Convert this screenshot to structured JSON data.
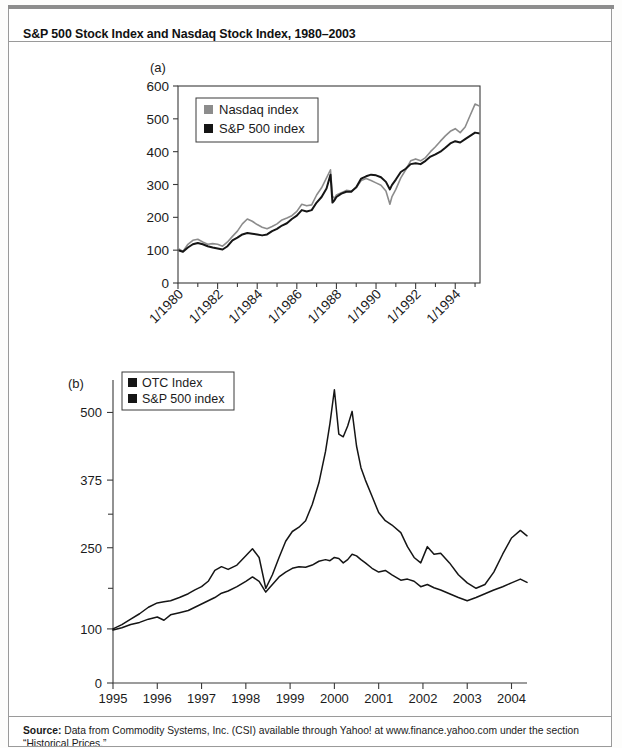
{
  "figure": {
    "title": "S&P 500 Stock Index and Nasdaq Stock Index, 1980–2003",
    "source_label": "Source:",
    "source_text": " Data from Commodity Systems, Inc. (CSI) available through Yahoo! at www.finance.yahoo.com under the section “Historical Prices.”"
  },
  "chart_data": [
    {
      "id": "panel-a",
      "type": "line",
      "panel_label": "(a)",
      "title": "",
      "xlabel": "",
      "ylabel": "",
      "grid": false,
      "legend_position": "top-left",
      "ylim": [
        0,
        600
      ],
      "yticks": [
        0,
        100,
        200,
        300,
        400,
        500,
        600
      ],
      "ytick_labels": [
        "0",
        "100",
        "200",
        "300",
        "400",
        "500",
        "600"
      ],
      "xlim": [
        1980,
        1995.25
      ],
      "xticks": [
        1980,
        1982,
        1984,
        1986,
        1988,
        1990,
        1992,
        1994
      ],
      "xtick_labels": [
        "1/1980",
        "1/1982",
        "1/1984",
        "1/1986",
        "1/1988",
        "1/1990",
        "1/1992",
        "1/1994"
      ],
      "xtick_minor": [
        1981,
        1983,
        1985,
        1987,
        1989,
        1991,
        1993,
        1995
      ],
      "series": [
        {
          "name": "Nasdaq index",
          "color": "#8c8c8c",
          "width": 1.6,
          "x": [
            1980.0,
            1980.25,
            1980.5,
            1980.75,
            1981.0,
            1981.25,
            1981.5,
            1981.75,
            1982.0,
            1982.25,
            1982.5,
            1982.75,
            1983.0,
            1983.25,
            1983.5,
            1983.75,
            1984.0,
            1984.25,
            1984.5,
            1984.75,
            1985.0,
            1985.25,
            1985.5,
            1985.75,
            1986.0,
            1986.25,
            1986.5,
            1986.75,
            1987.0,
            1987.25,
            1987.5,
            1987.7,
            1987.8,
            1987.9,
            1988.0,
            1988.25,
            1988.5,
            1988.75,
            1989.0,
            1989.25,
            1989.5,
            1989.75,
            1990.0,
            1990.25,
            1990.5,
            1990.7,
            1990.8,
            1991.0,
            1991.25,
            1991.5,
            1991.75,
            1992.0,
            1992.25,
            1992.5,
            1992.75,
            1993.0,
            1993.25,
            1993.5,
            1993.75,
            1994.0,
            1994.25,
            1994.5,
            1994.75,
            1995.0,
            1995.25
          ],
          "values": [
            105,
            96,
            118,
            130,
            133,
            125,
            118,
            120,
            118,
            112,
            125,
            142,
            158,
            180,
            195,
            188,
            178,
            170,
            165,
            172,
            180,
            192,
            198,
            205,
            218,
            240,
            235,
            238,
            268,
            290,
            320,
            345,
            265,
            258,
            268,
            275,
            282,
            280,
            290,
            312,
            318,
            312,
            305,
            298,
            280,
            240,
            262,
            285,
            320,
            345,
            372,
            378,
            372,
            382,
            400,
            415,
            432,
            448,
            462,
            470,
            458,
            475,
            510,
            545,
            538
          ]
        },
        {
          "name": "S&P 500 index",
          "color": "#151515",
          "width": 2.0,
          "x": [
            1980.0,
            1980.25,
            1980.5,
            1980.75,
            1981.0,
            1981.25,
            1981.5,
            1981.75,
            1982.0,
            1982.25,
            1982.5,
            1982.75,
            1983.0,
            1983.25,
            1983.5,
            1983.75,
            1984.0,
            1984.25,
            1984.5,
            1984.75,
            1985.0,
            1985.25,
            1985.5,
            1985.75,
            1986.0,
            1986.25,
            1986.5,
            1986.75,
            1987.0,
            1987.25,
            1987.5,
            1987.7,
            1987.8,
            1987.9,
            1988.0,
            1988.25,
            1988.5,
            1988.75,
            1989.0,
            1989.25,
            1989.5,
            1989.75,
            1990.0,
            1990.25,
            1990.5,
            1990.7,
            1990.8,
            1991.0,
            1991.25,
            1991.5,
            1991.75,
            1992.0,
            1992.25,
            1992.5,
            1992.75,
            1993.0,
            1993.25,
            1993.5,
            1993.75,
            1994.0,
            1994.25,
            1994.5,
            1994.75,
            1995.0,
            1995.25
          ],
          "values": [
            100,
            95,
            108,
            118,
            122,
            118,
            112,
            108,
            105,
            102,
            112,
            130,
            138,
            148,
            152,
            150,
            148,
            145,
            148,
            158,
            165,
            175,
            182,
            195,
            205,
            222,
            218,
            222,
            245,
            262,
            288,
            330,
            245,
            252,
            262,
            272,
            278,
            278,
            292,
            318,
            325,
            330,
            328,
            322,
            308,
            285,
            298,
            315,
            338,
            348,
            362,
            365,
            362,
            372,
            385,
            392,
            400,
            412,
            425,
            432,
            428,
            438,
            448,
            458,
            455
          ]
        }
      ]
    },
    {
      "id": "panel-b",
      "type": "line",
      "panel_label": "(b)",
      "title": "",
      "xlabel": "",
      "ylabel": "",
      "grid": false,
      "legend_position": "top-left",
      "ylim": [
        0,
        560
      ],
      "yticks": [
        0,
        100,
        250,
        375,
        500
      ],
      "ytick_labels": [
        "0",
        "100",
        "250",
        "375",
        "500"
      ],
      "ytick_minor": [
        175,
        312
      ],
      "xlim": [
        1995,
        2004.35
      ],
      "xticks": [
        1995,
        1996,
        1997,
        1998,
        1999,
        2000,
        2001,
        2002,
        2003,
        2004
      ],
      "xtick_labels": [
        "1995",
        "1996",
        "1997",
        "1998",
        "1999",
        "2000",
        "2001",
        "2002",
        "2003",
        "2004"
      ],
      "series": [
        {
          "name": "OTC Index",
          "color": "#151515",
          "width": 1.5,
          "x": [
            1995.0,
            1995.2,
            1995.4,
            1995.6,
            1995.8,
            1996.0,
            1996.15,
            1996.3,
            1996.5,
            1996.7,
            1996.85,
            1997.0,
            1997.15,
            1997.3,
            1997.45,
            1997.6,
            1997.8,
            1998.0,
            1998.15,
            1998.3,
            1998.45,
            1998.6,
            1998.75,
            1998.9,
            1999.05,
            1999.2,
            1999.35,
            1999.5,
            1999.65,
            1999.8,
            1999.9,
            2000.0,
            2000.1,
            2000.2,
            2000.3,
            2000.4,
            2000.5,
            2000.6,
            2000.7,
            2000.85,
            2001.0,
            2001.15,
            2001.3,
            2001.5,
            2001.65,
            2001.8,
            2001.95,
            2002.1,
            2002.25,
            2002.4,
            2002.6,
            2002.8,
            2003.0,
            2003.2,
            2003.4,
            2003.6,
            2003.8,
            2004.0,
            2004.2,
            2004.35
          ],
          "values": [
            100,
            108,
            118,
            128,
            140,
            148,
            150,
            152,
            158,
            165,
            172,
            178,
            188,
            208,
            215,
            210,
            218,
            235,
            248,
            232,
            175,
            200,
            232,
            262,
            280,
            288,
            300,
            330,
            370,
            428,
            480,
            542,
            460,
            455,
            475,
            502,
            438,
            398,
            375,
            345,
            315,
            300,
            292,
            278,
            252,
            232,
            222,
            252,
            238,
            240,
            222,
            200,
            185,
            175,
            182,
            205,
            238,
            268,
            282,
            272
          ]
        },
        {
          "name": "S&P 500 index",
          "color": "#151515",
          "width": 1.5,
          "x": [
            1995.0,
            1995.2,
            1995.4,
            1995.6,
            1995.8,
            1996.0,
            1996.15,
            1996.3,
            1996.5,
            1996.7,
            1996.85,
            1997.0,
            1997.15,
            1997.3,
            1997.45,
            1997.6,
            1997.8,
            1998.0,
            1998.15,
            1998.3,
            1998.45,
            1998.6,
            1998.75,
            1998.9,
            1999.05,
            1999.2,
            1999.35,
            1999.5,
            1999.65,
            1999.8,
            1999.9,
            2000.0,
            2000.1,
            2000.2,
            2000.3,
            2000.4,
            2000.5,
            2000.6,
            2000.7,
            2000.85,
            2001.0,
            2001.15,
            2001.3,
            2001.5,
            2001.65,
            2001.8,
            2001.95,
            2002.1,
            2002.25,
            2002.4,
            2002.6,
            2002.8,
            2003.0,
            2003.2,
            2003.4,
            2003.6,
            2003.8,
            2004.0,
            2004.2,
            2004.35
          ],
          "values": [
            98,
            102,
            108,
            112,
            118,
            122,
            116,
            126,
            130,
            134,
            140,
            146,
            152,
            158,
            166,
            170,
            178,
            188,
            196,
            188,
            168,
            182,
            196,
            205,
            212,
            215,
            214,
            218,
            225,
            228,
            226,
            232,
            230,
            222,
            228,
            238,
            235,
            228,
            222,
            212,
            205,
            208,
            200,
            190,
            192,
            188,
            178,
            182,
            176,
            172,
            165,
            158,
            152,
            158,
            165,
            172,
            178,
            185,
            192,
            186
          ]
        }
      ]
    }
  ]
}
